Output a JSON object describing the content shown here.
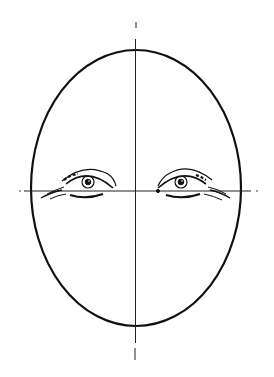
{
  "figure": {
    "title": "Face proportion guide: eye placement",
    "colors": {
      "ink": "#111111",
      "background": "#ffffff"
    }
  }
}
